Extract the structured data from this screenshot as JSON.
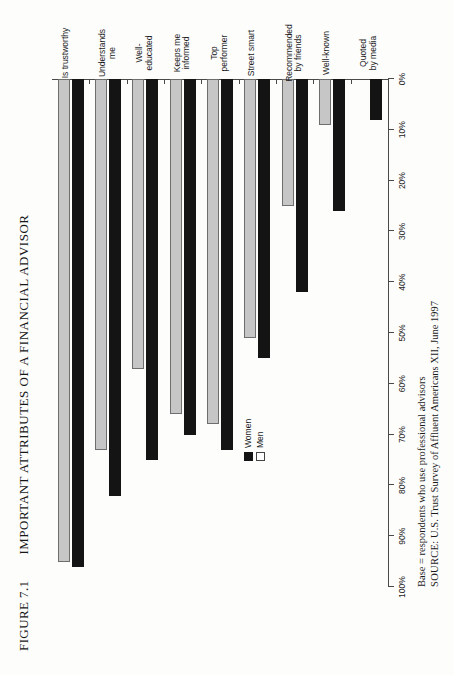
{
  "figure": {
    "number_label": "FIGURE 7.1",
    "title": "IMPORTANT ATTRIBUTES OF A FINANCIAL ADVISOR"
  },
  "legend": {
    "position": "center-left",
    "items": [
      {
        "label": "Women",
        "swatch": "black"
      },
      {
        "label": "Men",
        "swatch": "white"
      }
    ]
  },
  "notes": {
    "base": "Base = respondents who use professional advisors",
    "source_label": "SOURCE:",
    "source_text": "U.S. Trust Survey of Affluent Americans XII, June 1997"
  },
  "chart_data": {
    "type": "bar",
    "orientation": "horizontal",
    "title": "IMPORTANT ATTRIBUTES OF A FINANCIAL ADVISOR",
    "xlabel": "",
    "ylabel": "",
    "ylim": [
      0,
      100
    ],
    "grid": false,
    "legend_position": "center-left",
    "axis_tick_labels": [
      "0%",
      "10%",
      "20%",
      "30%",
      "40%",
      "50%",
      "60%",
      "70%",
      "80%",
      "90%",
      "100%"
    ],
    "axis_tick_values": [
      0,
      10,
      20,
      30,
      40,
      50,
      60,
      70,
      80,
      90,
      100
    ],
    "categories": [
      "Is trustworthy",
      "Understands\nme",
      "Well-\neducated",
      "Keeps me\ninformed",
      "Top\nperformer",
      "Street smart",
      "Recommended\nby friends",
      "Well-known",
      "Quoted\nby media"
    ],
    "series": [
      {
        "name": "Women",
        "color": "#141414",
        "values": [
          96,
          82,
          75,
          70,
          73,
          55,
          42,
          26,
          8
        ]
      },
      {
        "name": "Men",
        "color": "#c6c6c6",
        "values": [
          95,
          73,
          57,
          66,
          68,
          51,
          25,
          9,
          0
        ]
      }
    ]
  }
}
